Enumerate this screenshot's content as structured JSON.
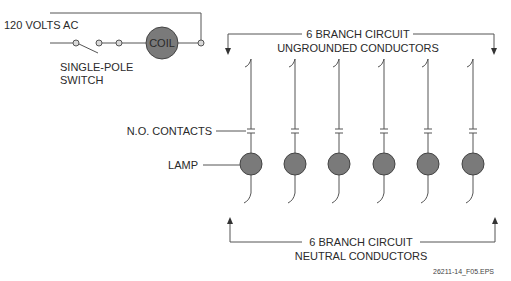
{
  "control_circuit": {
    "source_label": "120 VOLTS AC",
    "switch_label_line1": "SINGLE-POLE",
    "switch_label_line2": "SWITCH",
    "coil_label": "COIL"
  },
  "top_bracket": {
    "line1": "6 BRANCH CIRCUIT",
    "line2": "UNGROUNDED CONDUCTORS"
  },
  "bottom_bracket": {
    "line1": "6 BRANCH CIRCUIT",
    "line2": "NEUTRAL CONDUCTORS"
  },
  "callouts": {
    "contacts": "N.O. CONTACTS",
    "lamp": "LAMP"
  },
  "branches": [
    {
      "id": 1,
      "x": 251
    },
    {
      "id": 2,
      "x": 295
    },
    {
      "id": 3,
      "x": 339
    },
    {
      "id": 4,
      "x": 384
    },
    {
      "id": 5,
      "x": 428
    },
    {
      "id": 6,
      "x": 473
    }
  ],
  "figure_id": "26211-14_F05.EPS",
  "colors": {
    "line": "#555555",
    "component_fill": "#7a7a7a",
    "component_stroke": "#444444",
    "terminal_fill": "#d8d8d8"
  }
}
